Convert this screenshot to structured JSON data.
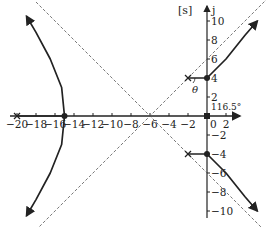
{
  "chart_data": {
    "type": "line",
    "plane_label": "[s]",
    "imag_axis_label": "j",
    "x_ticks": [
      -20,
      -18,
      -16,
      -14,
      -12,
      -10,
      -8,
      -6,
      -4,
      -2,
      0,
      2
    ],
    "x_tick_labels": [
      "−20",
      "−18",
      "−16",
      "−14",
      "−12",
      "−10",
      "−8",
      "−6",
      "−4",
      "−2",
      "0",
      "2"
    ],
    "y_ticks": [
      10,
      8,
      6,
      4,
      2,
      -2,
      -4,
      -6,
      -8,
      -10
    ],
    "y_tick_labels": [
      "10",
      "8",
      "6",
      "4",
      "2",
      "−2",
      "−4",
      "−6",
      "−8",
      "−10"
    ],
    "xlim": [
      -20.5,
      4
    ],
    "ylim": [
      -11,
      11
    ],
    "poles": [
      [
        -20,
        0
      ],
      [
        -2,
        4
      ],
      [
        -2,
        -4
      ],
      [
        0,
        0
      ]
    ],
    "zeros_or_points": [
      [
        0,
        4
      ],
      [
        0,
        -4
      ],
      [
        -15,
        0
      ]
    ],
    "asymptote_centroid": [
      -6,
      0
    ],
    "asymptote_angles_deg": [
      45,
      135,
      -45,
      -135
    ],
    "annotations": {
      "angle_label": "θ",
      "departure_angle": "116.5°"
    },
    "series": [
      {
        "name": "upper branch",
        "points": [
          [
            -2,
            4
          ],
          [
            0,
            4
          ],
          [
            2,
            6
          ],
          [
            4,
            8.5
          ],
          [
            5.3,
            10
          ]
        ]
      },
      {
        "name": "lower branch",
        "points": [
          [
            -2,
            -4
          ],
          [
            0,
            -4
          ],
          [
            2,
            -6
          ],
          [
            4,
            -8.5
          ],
          [
            5.3,
            -10
          ]
        ]
      },
      {
        "name": "left real branch",
        "points": [
          [
            -20,
            0
          ],
          [
            -15,
            0
          ]
        ]
      },
      {
        "name": "left upper breakaway",
        "points": [
          [
            -15,
            0
          ],
          [
            -15.3,
            3
          ],
          [
            -16.5,
            6
          ],
          [
            -18,
            8.8
          ],
          [
            -19,
            10.5
          ]
        ]
      },
      {
        "name": "left lower breakaway",
        "points": [
          [
            -15,
            0
          ],
          [
            -15.3,
            -3
          ],
          [
            -16.5,
            -6
          ],
          [
            -18,
            -8.8
          ],
          [
            -19,
            -10.5
          ]
        ]
      }
    ],
    "grid": false,
    "legend": "none"
  }
}
